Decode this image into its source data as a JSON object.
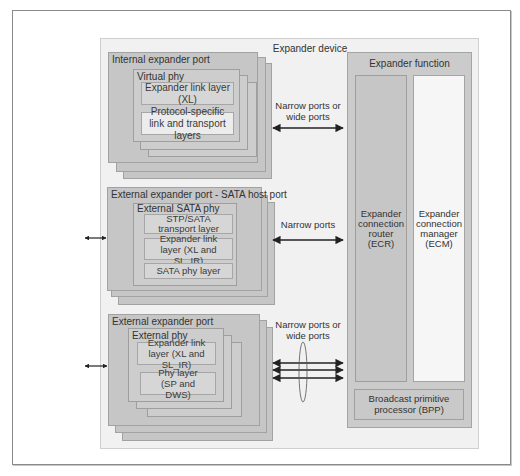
{
  "device": {
    "title": "Expander device",
    "internal_port": {
      "title": "Internal expander port",
      "phy_title": "Virtual phy",
      "layers": [
        "Expander link layer (XL)",
        "Protocol-specific link and transport layers"
      ]
    },
    "sata_port": {
      "title": "External expander port - SATA host port",
      "phy_title": "External SATA phy",
      "layers": [
        "STP/SATA transport layer",
        "Expander link layer (XL and SL_IR)",
        "SATA phy layer"
      ]
    },
    "external_port": {
      "title": "External expander port",
      "phy_title": "External phy",
      "layers": [
        "Expander link layer (XL and SL_IR)",
        "Phy layer (SP and DWS)"
      ]
    },
    "connections": {
      "top_line1": "Narrow ports or",
      "top_line2": "wide ports",
      "middle": "Narrow ports",
      "bottom_line1": "Narrow ports or",
      "bottom_line2": "wide ports"
    },
    "function": {
      "title": "Expander function",
      "ecr": [
        "Expander",
        "connection",
        "router",
        "(ECR)"
      ],
      "ecm": [
        "Expander",
        "connection",
        "manager",
        "(ECM)"
      ],
      "bpp": [
        "Broadcast primitive",
        "processor (BPP)"
      ]
    }
  }
}
